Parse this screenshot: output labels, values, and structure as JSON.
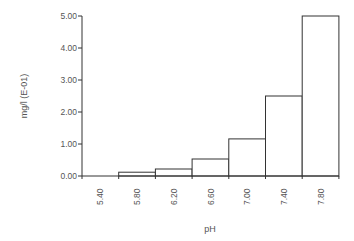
{
  "chart_data": {
    "type": "bar",
    "title": "",
    "xlabel": "pH",
    "ylabel": "mg/l (E-01)",
    "categories": [
      "5.40",
      "5.80",
      "6.20",
      "6.60",
      "7.00",
      "7.40",
      "7.80"
    ],
    "values": [
      0.0,
      0.12,
      0.22,
      0.53,
      1.16,
      2.5,
      5.0
    ],
    "ylim": [
      0,
      5
    ],
    "yticks": [
      "0.00",
      "1.00",
      "2.00",
      "3.00",
      "4.00",
      "5.00"
    ],
    "grid": false,
    "legend": null,
    "style": {
      "bar_fill": "#ffffff",
      "bar_stroke": "#333333",
      "bar_gap": 0,
      "xtick_rotation": -90
    }
  }
}
